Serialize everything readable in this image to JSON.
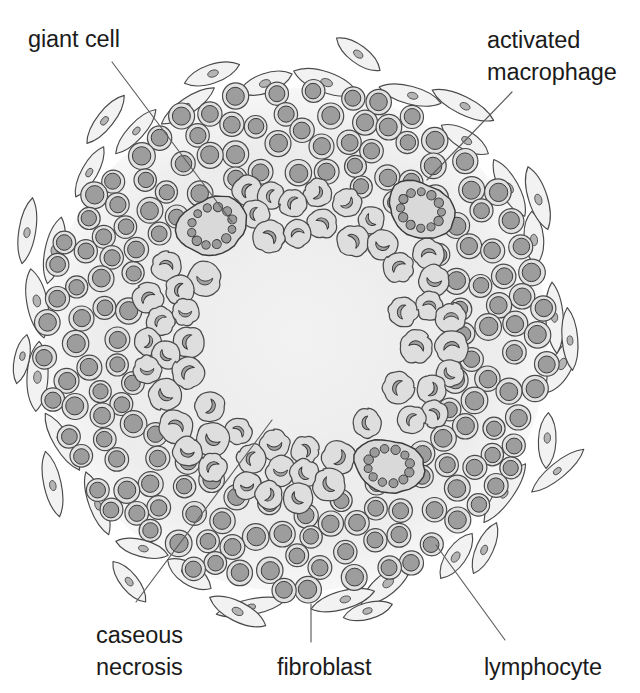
{
  "figure": {
    "canvas": {
      "width": 640,
      "height": 693
    },
    "background_color": "#ffffff",
    "palette": {
      "ink": "#4a4a4a",
      "ink_dark": "#3a3a3a",
      "label_text": "#1b1b1b",
      "leader_line": "#5d5d5d",
      "granuloma_fill": "#ededed",
      "necrosis_fill": "#f1f1f1",
      "lymphocyte_fill": "#e2e2e2",
      "lymphocyte_nucleus": "#9d9d9d",
      "macrophage_fill": "#dedede",
      "macrophage_nucleus": "#a2a2a2",
      "giant_cell_fill": "#d9d9d9",
      "giant_cell_nucleus": "#9a9a9a",
      "fibroblast_fill": "#f2f2f2",
      "fibroblast_nucleus": "#b4b4b4"
    }
  },
  "labels": [
    {
      "id": "giant-cell",
      "text": "giant cell",
      "lines": [
        "giant cell"
      ],
      "x": 28,
      "y": 47,
      "anchor": "start",
      "leader": [
        [
          112,
          62
        ],
        [
          232,
          222
        ]
      ]
    },
    {
      "id": "activated-macrophage",
      "text": "activated macrophage",
      "lines": [
        "activated",
        "macrophage"
      ],
      "x": 487,
      "y": 48,
      "anchor": "start",
      "leader": [
        [
          512,
          92
        ],
        [
          427,
          180
        ]
      ]
    },
    {
      "id": "caseous-necrosis",
      "text": "caseous necrosis",
      "lines": [
        "caseous",
        "necrosis"
      ],
      "x": 96,
      "y": 643,
      "anchor": "start",
      "leader": [
        [
          136,
          602
        ],
        [
          272,
          420
        ]
      ]
    },
    {
      "id": "fibroblast",
      "text": "fibroblast",
      "lines": [
        "fibroblast"
      ],
      "x": 277,
      "y": 675,
      "anchor": "start",
      "leader": [
        [
          311,
          642
        ],
        [
          311,
          604
        ]
      ]
    },
    {
      "id": "lymphocyte",
      "text": "lymphocyte",
      "lines": [
        "lymphocyte"
      ],
      "x": 484,
      "y": 675,
      "anchor": "start",
      "leader": [
        [
          505,
          640
        ],
        [
          436,
          545
        ]
      ]
    }
  ],
  "geometry": {
    "center": {
      "x": 296,
      "y": 340
    },
    "granuloma_radius": 252,
    "necrosis_radius": 103,
    "macrophage_band": {
      "inner": 106,
      "outer": 158
    },
    "lymphocyte_band": {
      "inner": 160,
      "outer": 252
    },
    "fibroblast_ring_radius": 262,
    "fibroblast_ring2_radius": 284
  },
  "cell_types": {
    "lymphocyte": {
      "name": "lymphocyte",
      "shape": "circle",
      "radius": 12.2,
      "nucleus_radius": 8.4,
      "count": 196
    },
    "activated_macrophage": {
      "name": "activated macrophage",
      "shape": "lobed-polygon",
      "radius": 15.5,
      "lobes": 8,
      "count": 92
    },
    "giant_cell": {
      "name": "giant cell",
      "shape": "blob",
      "radius": 32,
      "nuclei_count": 12,
      "count": 3
    },
    "fibroblast": {
      "name": "fibroblast",
      "shape": "spindle",
      "length": 60,
      "width": 13,
      "count": 38
    }
  },
  "giant_cells": [
    {
      "cx": 212,
      "cy": 226,
      "rx": 34,
      "ry": 29,
      "rot": -28,
      "nuclei": 12
    },
    {
      "cx": 421,
      "cy": 210,
      "rx": 33,
      "ry": 28,
      "rot": 22,
      "nuclei": 12
    },
    {
      "cx": 389,
      "cy": 466,
      "rx": 34,
      "ry": 27,
      "rot": 8,
      "nuclei": 12
    }
  ],
  "regions": [
    {
      "id": "caseous-necrosis",
      "label": "caseous necrosis",
      "description": "amorphous pale central zone"
    },
    {
      "id": "macrophage-ring",
      "label": "activated macrophages",
      "description": "epithelioid cell ring surrounding necrosis"
    },
    {
      "id": "lymphocyte-cuff",
      "label": "lymphocytes",
      "description": "dense outer cuff of small round cells"
    },
    {
      "id": "fibroblast-capsule",
      "label": "fibroblasts",
      "description": "radially oriented spindle cells at the rim"
    }
  ]
}
